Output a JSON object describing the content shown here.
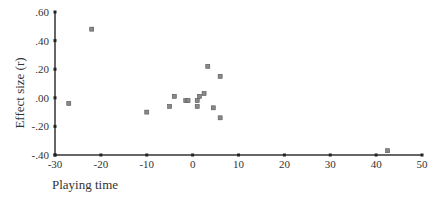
{
  "chart_data": {
    "type": "scatter",
    "title": "",
    "xlabel": "Playing time",
    "ylabel": "Effect size (r)",
    "xlim": [
      -30,
      50
    ],
    "ylim": [
      -0.4,
      0.6
    ],
    "x_ticks": [
      -30,
      -20,
      -10,
      0,
      10,
      20,
      30,
      40,
      50
    ],
    "x_tick_labels": [
      "-30",
      "-20",
      "-10",
      "0",
      "10",
      "20",
      "30",
      "40",
      "50"
    ],
    "y_ticks": [
      0.6,
      0.4,
      0.2,
      0.0,
      -0.2,
      -0.4
    ],
    "y_tick_labels": [
      ".60",
      ".40",
      ".20",
      ".00",
      "-.20",
      "-.40"
    ],
    "grid": false,
    "legend": null,
    "points": [
      {
        "x": -27,
        "y": -0.04
      },
      {
        "x": -22,
        "y": 0.48
      },
      {
        "x": -10,
        "y": -0.1
      },
      {
        "x": -5,
        "y": -0.06
      },
      {
        "x": -4,
        "y": 0.01
      },
      {
        "x": -1.5,
        "y": -0.02
      },
      {
        "x": -1,
        "y": -0.02
      },
      {
        "x": 1,
        "y": -0.02
      },
      {
        "x": 1,
        "y": -0.06
      },
      {
        "x": 1.5,
        "y": 0.01
      },
      {
        "x": 2.5,
        "y": 0.03
      },
      {
        "x": 3.3,
        "y": 0.22
      },
      {
        "x": 4.5,
        "y": -0.07
      },
      {
        "x": 6,
        "y": 0.15
      },
      {
        "x": 6,
        "y": -0.14
      },
      {
        "x": 42.5,
        "y": -0.37
      }
    ]
  }
}
